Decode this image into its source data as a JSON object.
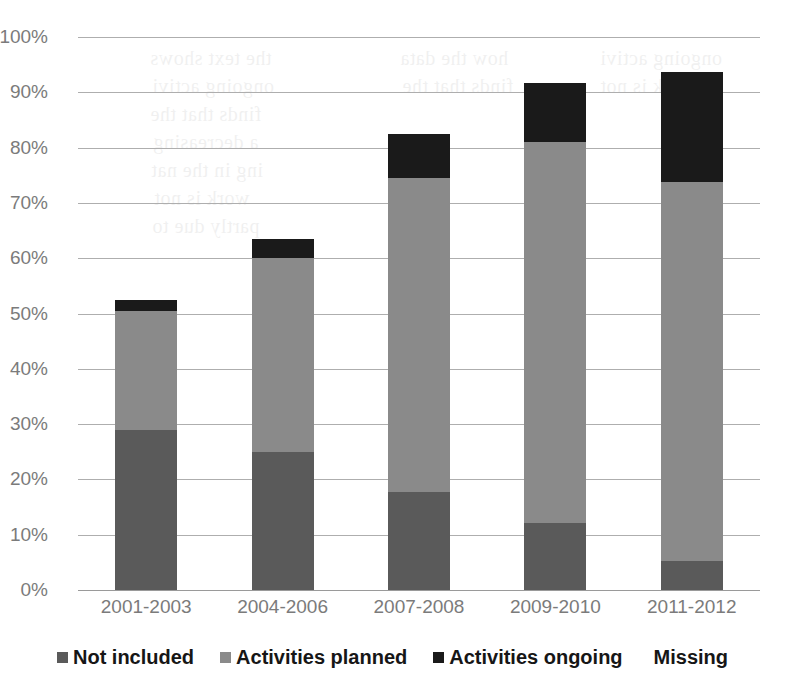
{
  "chart_data": {
    "type": "bar",
    "stacked": true,
    "stack_mode": "percent",
    "title": "",
    "subtitle": "",
    "xlabel": "",
    "ylabel": "",
    "ylim": [
      0,
      100
    ],
    "grid": true,
    "legend_position": "bottom",
    "categories": [
      "2001-2003",
      "2004-2006",
      "2007-2008",
      "2009-2010",
      "2011-2012"
    ],
    "ytick_labels": [
      "0%",
      "10%",
      "20%",
      "30%",
      "40%",
      "50%",
      "60%",
      "70%",
      "80%",
      "90%",
      "100%"
    ],
    "ytick_values": [
      0,
      10,
      20,
      30,
      40,
      50,
      60,
      70,
      80,
      90,
      100
    ],
    "series": [
      {
        "name": "Not included",
        "color": "#5a5a5a",
        "values": [
          29,
          25,
          17.7,
          12.1,
          5.3
        ]
      },
      {
        "name": "Activities planned",
        "color": "#8a8a8a",
        "values": [
          21.5,
          35,
          56.8,
          68.9,
          68.5
        ]
      },
      {
        "name": "Activities ongoing",
        "color": "#1a1a1a",
        "values": [
          2,
          3.5,
          8,
          10.7,
          19.8
        ]
      },
      {
        "name": "Missing",
        "color": "#ffffff",
        "values": [
          47.5,
          36.5,
          17.5,
          8.3,
          6.4
        ]
      }
    ]
  },
  "legend": {
    "items": [
      {
        "label": "Not included",
        "color": "#5a5a5a",
        "marker": "square-swatch",
        "has_marker": true
      },
      {
        "label": "Activities planned",
        "color": "#8a8a8a",
        "marker": "square-swatch",
        "has_marker": true
      },
      {
        "label": "Activities ongoing",
        "color": "#1a1a1a",
        "marker": "square-swatch",
        "has_marker": true
      },
      {
        "label": "Missing",
        "color": "#ffffff",
        "marker": "none",
        "has_marker": false
      }
    ]
  },
  "ghost_text": {
    "lines": [
      "the text shows",
      "ongoing activi",
      "finds that the",
      "a decreasing",
      "ing in the nat",
      "work is not",
      "partly due to",
      "how the data"
    ]
  }
}
